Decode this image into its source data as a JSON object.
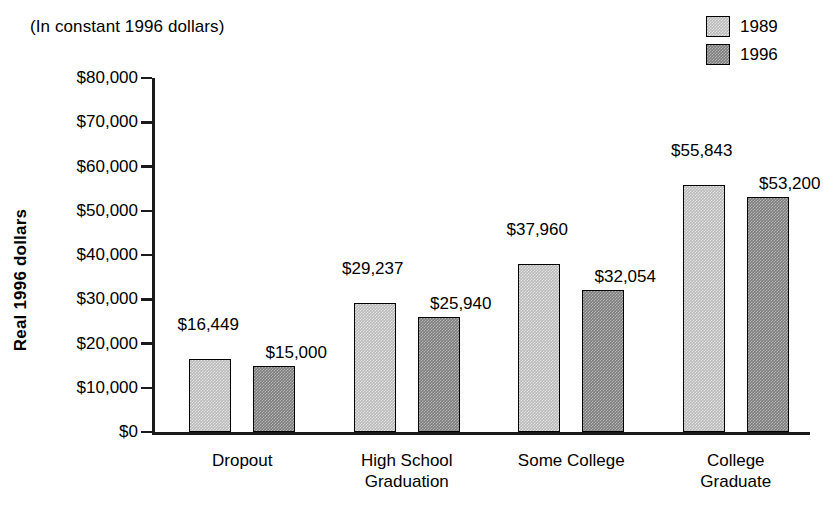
{
  "subtitle": "(In constant 1996 dollars)",
  "legend": {
    "items": [
      {
        "label": "1989",
        "color": "#b9b9b9"
      },
      {
        "label": "1996",
        "color": "#7d7d7d"
      }
    ]
  },
  "axis": {
    "y_title": "Real 1996 dollars",
    "y_ticks": [
      "$80,000",
      "$70,000",
      "$60,000",
      "$50,000",
      "$40,000",
      "$30,000",
      "$20,000",
      "$10,000",
      "$0"
    ]
  },
  "chart_data": {
    "type": "bar",
    "title": "",
    "subtitle": "(In constant 1996 dollars)",
    "xlabel": "",
    "ylabel": "Real 1996 dollars",
    "ylim": [
      0,
      80000
    ],
    "ytick_step": 10000,
    "grid": false,
    "legend_position": "top-right",
    "categories": [
      "Dropout",
      "High School\nGraduation",
      "Some College",
      "College\nGraduate"
    ],
    "series": [
      {
        "name": "1989",
        "color": "#b9b9b9",
        "values": [
          16449,
          29237,
          37960,
          55843
        ],
        "labels": [
          "$16,449",
          "$29,237",
          "$37,960",
          "$55,843"
        ]
      },
      {
        "name": "1996",
        "color": "#7d7d7d",
        "values": [
          15000,
          25940,
          32054,
          53200
        ],
        "labels": [
          "$15,000",
          "$25,940",
          "$32,054",
          "$53,200"
        ]
      }
    ]
  }
}
